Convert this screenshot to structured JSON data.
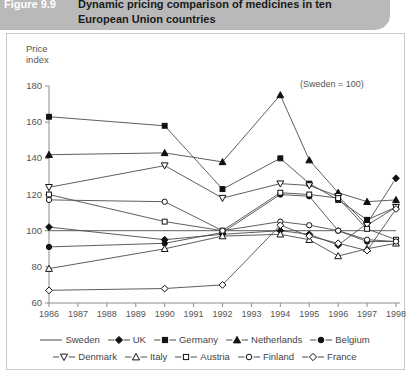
{
  "figure": {
    "label": "Figure 9.9",
    "title": "Dynamic pricing comparison of medicines in ten European Union countries"
  },
  "axis": {
    "y_title_line1": "Price",
    "y_title_line2": "index",
    "annotation": "(Sweden = 100)"
  },
  "chart_data": {
    "type": "line",
    "title": "Dynamic pricing comparison of medicines in ten European Union countries",
    "subtitle": "(Sweden = 100)",
    "xlabel": "",
    "ylabel": "Price index",
    "ylim": [
      60,
      180
    ],
    "ytick_step": 20,
    "yticks": [
      60,
      80,
      100,
      120,
      140,
      160,
      180
    ],
    "grid": false,
    "legend_position": "bottom",
    "x": [
      1986,
      1987,
      1988,
      1989,
      1990,
      1991,
      1992,
      1993,
      1994,
      1995,
      1996,
      1997,
      1998
    ],
    "xticks": [
      "1986",
      "1987",
      "1988",
      "1989",
      "1990",
      "1991",
      "1992",
      "1993",
      "1994",
      "1995",
      "1996",
      "1997",
      "1998"
    ],
    "data_years": [
      1986,
      1990,
      1992,
      1994,
      1995,
      1996,
      1997,
      1998
    ],
    "series": [
      {
        "name": "Sweden",
        "marker": "none",
        "filled": false,
        "x": [
          1986,
          1998
        ],
        "values": [
          100,
          100
        ]
      },
      {
        "name": "UK",
        "marker": "diamond",
        "filled": true,
        "x": [
          1986,
          1990,
          1992,
          1994,
          1995,
          1996,
          1997,
          1998
        ],
        "values": [
          102,
          95,
          98,
          100,
          98,
          92,
          104,
          129
        ]
      },
      {
        "name": "Germany",
        "marker": "square",
        "filled": true,
        "x": [
          1986,
          1990,
          1992,
          1994,
          1995,
          1996,
          1997,
          1998
        ],
        "values": [
          163,
          158,
          123,
          140,
          126,
          117,
          106,
          113
        ]
      },
      {
        "name": "Netherlands",
        "marker": "triangle-up",
        "filled": true,
        "x": [
          1986,
          1990,
          1992,
          1994,
          1995,
          1996,
          1997,
          1998
        ],
        "values": [
          142,
          143,
          138,
          175,
          139,
          121,
          116,
          117
        ]
      },
      {
        "name": "Belgium",
        "marker": "circle",
        "filled": true,
        "x": [
          1986,
          1990,
          1992,
          1994,
          1995,
          1996,
          1997,
          1998
        ],
        "values": [
          91,
          93,
          99,
          120,
          119,
          100,
          94,
          94
        ]
      },
      {
        "name": "Denmark",
        "marker": "triangle-down",
        "filled": false,
        "x": [
          1986,
          1990,
          1992,
          1994,
          1995,
          1996,
          1997,
          1998
        ],
        "values": [
          124,
          136,
          118,
          126,
          125,
          119,
          103,
          113
        ]
      },
      {
        "name": "Italy",
        "marker": "triangle-up",
        "filled": false,
        "x": [
          1986,
          1990,
          1992,
          1994,
          1995,
          1996,
          1997,
          1998
        ],
        "values": [
          79,
          90,
          97,
          98,
          95,
          86,
          90,
          93
        ]
      },
      {
        "name": "Austria",
        "marker": "square",
        "filled": false,
        "x": [
          1986,
          1990,
          1992,
          1994,
          1995,
          1996,
          1997,
          1998
        ],
        "values": [
          120,
          105,
          100,
          121,
          120,
          118,
          101,
          95
        ]
      },
      {
        "name": "Finland",
        "marker": "circle",
        "filled": false,
        "x": [
          1986,
          1990,
          1992,
          1994,
          1995,
          1996,
          1997,
          1998
        ],
        "values": [
          117,
          116,
          100,
          105,
          103,
          100,
          95,
          94
        ]
      },
      {
        "name": "France",
        "marker": "diamond",
        "filled": false,
        "x": [
          1986,
          1990,
          1992,
          1994,
          1995,
          1996,
          1997,
          1998
        ],
        "values": [
          67,
          68,
          70,
          103,
          97,
          93,
          89,
          112
        ]
      }
    ]
  },
  "legend": {
    "rows": [
      [
        {
          "label": "Sweden",
          "marker": "none",
          "filled": false
        },
        {
          "label": "UK",
          "marker": "diamond",
          "filled": true
        },
        {
          "label": "Germany",
          "marker": "square",
          "filled": true
        },
        {
          "label": "Netherlands",
          "marker": "triangle-up",
          "filled": true
        },
        {
          "label": "Belgium",
          "marker": "circle",
          "filled": true
        }
      ],
      [
        {
          "label": "Denmark",
          "marker": "triangle-down",
          "filled": false
        },
        {
          "label": "Italy",
          "marker": "triangle-up",
          "filled": false
        },
        {
          "label": "Austria",
          "marker": "square",
          "filled": false
        },
        {
          "label": "Finland",
          "marker": "circle",
          "filled": false
        },
        {
          "label": "France",
          "marker": "diamond",
          "filled": false
        }
      ]
    ]
  },
  "colors": {
    "banner": "#b9b9b9",
    "line": "#4d4d4d",
    "marker_fill": "#111111",
    "axis": "#8c8c8c",
    "text": "#555555"
  }
}
